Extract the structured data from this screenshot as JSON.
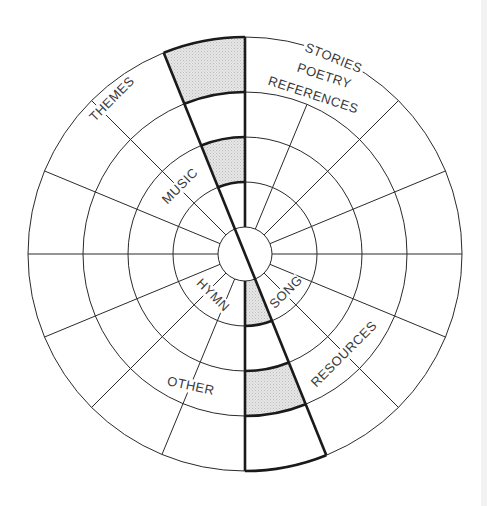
{
  "diagram": {
    "type": "concentric-wheel",
    "center": [
      245,
      254
    ],
    "radii": [
      27,
      72,
      117,
      162,
      217
    ],
    "highlight_angle_deg": 22,
    "colors": {
      "line": "#2a2a2a",
      "shade": "#dcdcdc",
      "background": "#ffffff"
    },
    "labels": {
      "stories": "STORIES",
      "poetry": "POETRY",
      "references": "REFERENCES",
      "themes": "THEMES",
      "music": "MUSIC",
      "song": "SONG",
      "hymn": "HYMN",
      "resources": "RESOURCES",
      "other": "OTHER"
    },
    "shaded_segments": [
      {
        "wedge": "top",
        "ring": "162-217"
      },
      {
        "wedge": "top",
        "ring": "72-117"
      },
      {
        "wedge": "bottom",
        "ring": "27-72"
      },
      {
        "wedge": "bottom",
        "ring": "117-162"
      }
    ]
  }
}
